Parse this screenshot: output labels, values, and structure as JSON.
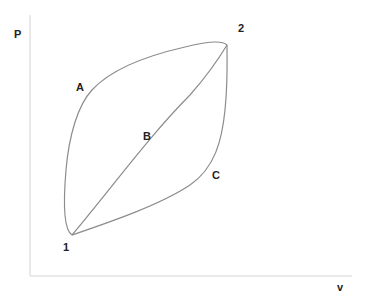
{
  "diagram": {
    "type": "pv-diagram",
    "axes": {
      "y_label": "P",
      "x_label": "v"
    },
    "states": [
      {
        "id": "state-1",
        "label": "1"
      },
      {
        "id": "state-2",
        "label": "2"
      }
    ],
    "paths": [
      {
        "id": "path-a",
        "label": "A",
        "description": "upper convex path from 1 to 2"
      },
      {
        "id": "path-b",
        "label": "B",
        "description": "straight path from 1 to 2"
      },
      {
        "id": "path-c",
        "label": "C",
        "description": "lower concave path from 1 to 2"
      }
    ],
    "colors": {
      "curve": "#8c8c8c",
      "axis": "#d4d4d4",
      "text": "#222222",
      "background": "#ffffff"
    }
  }
}
